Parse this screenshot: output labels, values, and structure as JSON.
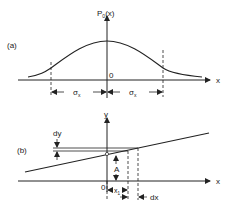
{
  "figure_a": {
    "panel_label": "(a)",
    "y_axis_label": "P",
    "y_axis_sub": "0",
    "y_axis_arg": "(x)",
    "x_axis_label": "x",
    "origin_label": "0",
    "sigma_left": "σ",
    "sigma_left_sub": "x",
    "sigma_right": "σ",
    "sigma_right_sub": "x",
    "curve": "gaussian"
  },
  "figure_b": {
    "panel_label": "(b)",
    "y_axis_label": "y",
    "x_axis_label": "x",
    "origin_label": "0",
    "dy_label": "dy",
    "A_label": "A",
    "x1_label": "x",
    "x1_sub": "1",
    "dx_label": "dx"
  },
  "colors": {
    "ink": "#222222",
    "background": "#ffffff"
  }
}
